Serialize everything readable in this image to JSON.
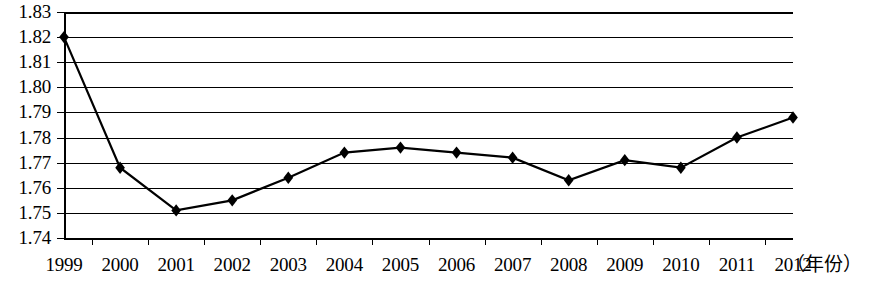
{
  "chart_data": {
    "type": "line",
    "title": "",
    "xlabel": "（年份）",
    "ylabel": "",
    "categories": [
      "1999",
      "2000",
      "2001",
      "2002",
      "2003",
      "2004",
      "2005",
      "2006",
      "2007",
      "2008",
      "2009",
      "2010",
      "2011",
      "2012"
    ],
    "values": [
      1.82,
      1.768,
      1.751,
      1.755,
      1.764,
      1.774,
      1.776,
      1.774,
      1.772,
      1.763,
      1.771,
      1.768,
      1.78,
      1.788
    ],
    "series": [
      {
        "name": "",
        "values": [
          1.82,
          1.768,
          1.751,
          1.755,
          1.764,
          1.774,
          1.776,
          1.774,
          1.772,
          1.763,
          1.771,
          1.768,
          1.78,
          1.788
        ]
      }
    ],
    "ylim": [
      1.74,
      1.83
    ],
    "ytick_labels": [
      "1.83",
      "1.82",
      "1.81",
      "1.80",
      "1.79",
      "1.78",
      "1.77",
      "1.76",
      "1.75",
      "1.74"
    ],
    "ytick_values": [
      1.83,
      1.82,
      1.81,
      1.8,
      1.79,
      1.78,
      1.77,
      1.76,
      1.75,
      1.74
    ],
    "grid": true,
    "legend": false,
    "legend_position": "none",
    "marker": "diamond",
    "line_color": "#000000",
    "marker_color": "#000000",
    "grid_color": "#000000",
    "background_color": "#ffffff"
  }
}
